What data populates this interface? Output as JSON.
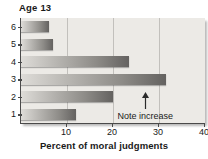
{
  "chart_data": {
    "type": "bar",
    "orientation": "horizontal",
    "title": "Age 13",
    "xlabel": "Percent of moral judgments",
    "ylabel": "",
    "categories": [
      "6",
      "5",
      "4",
      "3",
      "2",
      "1"
    ],
    "values": [
      6,
      7,
      23.5,
      31.5,
      20,
      12
    ],
    "xlim": [
      0,
      40
    ],
    "xticks": [
      10,
      20,
      30,
      40
    ],
    "xticklabels": [
      "10",
      "20",
      "30",
      "40"
    ],
    "grid": true,
    "grid_axis": "x",
    "legend": false,
    "annotations": [
      {
        "text": "Note increase",
        "x": 27,
        "category": "2",
        "arrow": "up",
        "arrow_icon": "up-arrow-icon"
      }
    ],
    "colors": {
      "bar_gradient_start": "#dedcd8",
      "bar_gradient_end": "#646260",
      "plot_background": "#eceae6",
      "axis": "#4a4a4a",
      "gridline": "#c2c0bc",
      "text": "#1a1a1a"
    }
  }
}
